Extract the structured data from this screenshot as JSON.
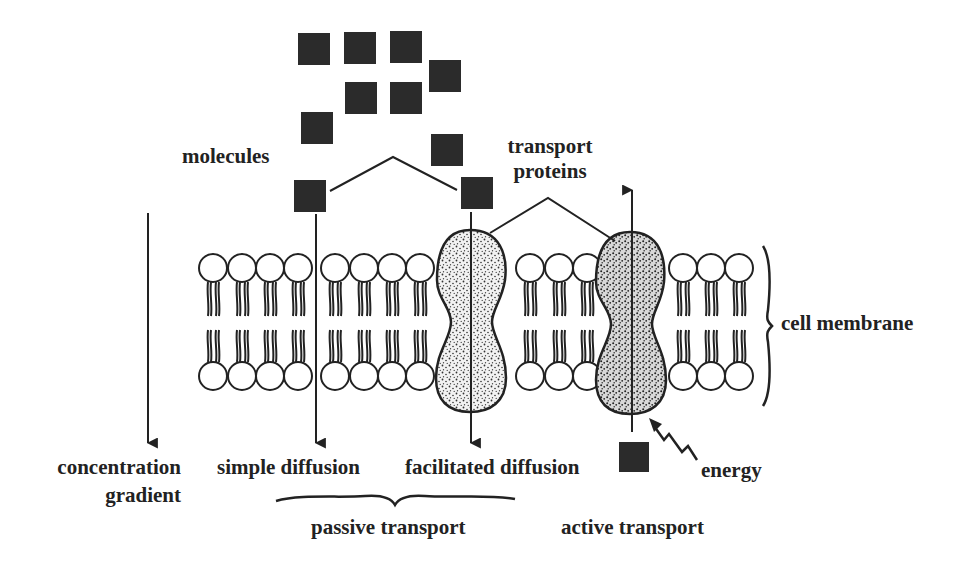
{
  "diagram": {
    "labels": {
      "molecules": "molecules",
      "transport_proteins_line1": "transport",
      "transport_proteins_line2": "proteins",
      "cell_membrane": "cell membrane",
      "concentration_line1": "concentration",
      "concentration_line2": "gradient",
      "simple_diffusion": "simple diffusion",
      "facilitated_diffusion": "facilitated diffusion",
      "energy": "energy",
      "passive_transport": "passive transport",
      "active_transport": "active transport"
    },
    "colors": {
      "ink": "#222222",
      "molecule": "#2b2b2b",
      "background": "#ffffff"
    },
    "molecules": [
      {
        "x": 298,
        "y": 33,
        "s": 32
      },
      {
        "x": 344,
        "y": 32,
        "s": 32
      },
      {
        "x": 390,
        "y": 31,
        "s": 32
      },
      {
        "x": 429,
        "y": 60,
        "s": 32
      },
      {
        "x": 345,
        "y": 82,
        "s": 32
      },
      {
        "x": 390,
        "y": 82,
        "s": 32
      },
      {
        "x": 301,
        "y": 112,
        "s": 32
      },
      {
        "x": 431,
        "y": 134,
        "s": 32
      },
      {
        "x": 294,
        "y": 180,
        "s": 32
      },
      {
        "x": 461,
        "y": 177,
        "s": 32
      },
      {
        "x": 619,
        "y": 442,
        "s": 30
      }
    ],
    "lipid_groups": [
      [
        213,
        242,
        270,
        298
      ],
      [
        335,
        364,
        392,
        420
      ],
      [
        530,
        559,
        587
      ],
      [
        683,
        711,
        739
      ]
    ]
  }
}
